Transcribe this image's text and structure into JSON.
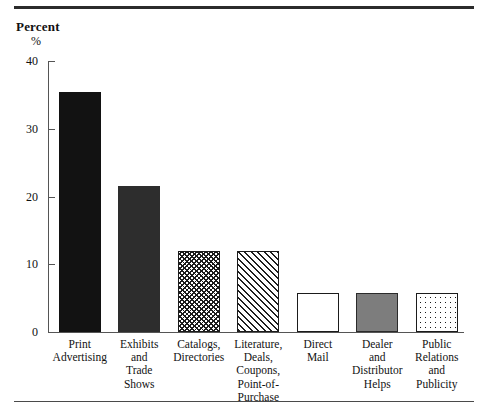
{
  "figure": {
    "axis_title": "Percent",
    "axis_unit": "%",
    "rule_color": "#2b2b2b"
  },
  "chart_data": {
    "type": "bar",
    "title": "Percent",
    "xlabel": "",
    "ylabel": "Percent",
    "ylim": [
      0,
      40
    ],
    "yticks": [
      0,
      10,
      20,
      30,
      40
    ],
    "grid": false,
    "legend": "none",
    "categories": [
      "Print Advertising",
      "Exhibits and Trade Shows",
      "Catalogs, Directories",
      "Literature, Deals, Coupons, Point-of-Purchase",
      "Direct Mail",
      "Dealer and Distributor Helps",
      "Public Relations and Publicity"
    ],
    "category_lines": [
      [
        "Print",
        "Advertising"
      ],
      [
        "Exhibits",
        "and",
        "Trade",
        "Shows"
      ],
      [
        "Catalogs,",
        "Directories"
      ],
      [
        "Literature,",
        "Deals,",
        "Coupons,",
        "Point-of-",
        "Purchase"
      ],
      [
        "Direct",
        "Mail"
      ],
      [
        "Dealer",
        "and",
        "Distributor",
        "Helps"
      ],
      [
        "Public",
        "Relations",
        "and",
        "Publicity"
      ]
    ],
    "values": [
      35.5,
      21.5,
      12.0,
      12.0,
      5.7,
      5.7,
      5.7
    ],
    "fills": [
      "solid-black",
      "solid-darkgray",
      "crosshatch",
      "diagonal",
      "empty",
      "solid-gray",
      "dots"
    ],
    "fill_colors": {
      "solid-black": "#121212",
      "solid-darkgray": "#2d2d2d",
      "solid-gray": "#7d7d7d",
      "empty": "#ffffff",
      "pattern-ink": "#1b1b1b"
    }
  }
}
